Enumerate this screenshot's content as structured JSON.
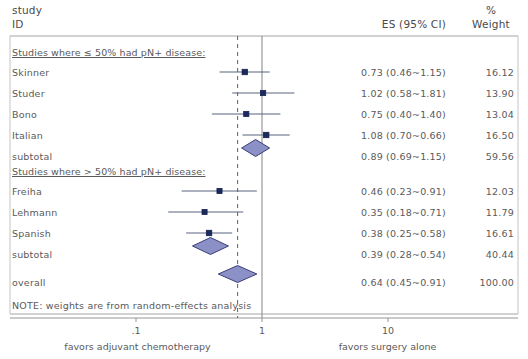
{
  "header": {
    "study_label": "study",
    "id_label": "ID",
    "es_label": "ES (95% CI)",
    "percent_label": "%",
    "weight_label": "Weight"
  },
  "note": "NOTE: weights are from random-effects analysis",
  "axis": {
    "left_caption": "favors adjuvant chemotherapy",
    "right_caption": "favors surgery alone",
    "ticks": [
      {
        "label": ".1",
        "value": 0.1
      },
      {
        "label": "1",
        "value": 1
      },
      {
        "label": "10",
        "value": 10
      }
    ],
    "null_line": 1,
    "pooled_line": 0.64,
    "xmin": 0.0631,
    "xmax": 22.0
  },
  "colors": {
    "marker_fill": "#1b2a5e",
    "marker_edge": "#16234f",
    "ci_line": "#5a6480",
    "diamond_fill": "#8b90c6",
    "diamond_edge": "#3a3f7a",
    "axis": "#8a8a8a",
    "dashed": "#6e6e6e",
    "text": "#5a5a5a"
  },
  "chart_data": {
    "type": "forest",
    "title": "",
    "xlabel": "",
    "ylabel": "",
    "effect_measure": "ES (95% CI)",
    "xscale": "log",
    "xlim": [
      0.0631,
      22.0
    ],
    "xticks": [
      0.1,
      1,
      10
    ],
    "xticklabels": [
      ".1",
      "1",
      "10"
    ],
    "null_value": 1,
    "overall_value": 0.64,
    "groups": [
      {
        "heading": "Studies  where ≤ 50% had pN+ disease:",
        "rows": [
          {
            "label": "Skinner",
            "es_text": "0.73 (0.46~1.15)",
            "weight_text": "16.12",
            "es": 0.73,
            "lcl": 0.46,
            "ucl": 1.15,
            "weight": 16.12,
            "type": "study"
          },
          {
            "label": "Studer",
            "es_text": "1.02 (0.58~1.81)",
            "weight_text": "13.90",
            "es": 1.02,
            "lcl": 0.58,
            "ucl": 1.81,
            "weight": 13.9,
            "type": "study"
          },
          {
            "label": "Bono",
            "es_text": "0.75 (0.40~1.40)",
            "weight_text": "13.04",
            "es": 0.75,
            "lcl": 0.4,
            "ucl": 1.4,
            "weight": 13.04,
            "type": "study"
          },
          {
            "label": "Italian",
            "es_text": "1.08 (0.70~0.66)",
            "weight_text": "16.50",
            "es": 1.08,
            "lcl": 0.7,
            "ucl": 1.66,
            "weight": 16.5,
            "type": "study"
          },
          {
            "label": "subtotal",
            "es_text": "0.89 (0.69~1.15)",
            "weight_text": "59.56",
            "es": 0.89,
            "lcl": 0.69,
            "ucl": 1.15,
            "weight": 59.56,
            "type": "subtotal"
          }
        ]
      },
      {
        "heading": "Studies  where > 50% had pN+ disease:",
        "rows": [
          {
            "label": "Freiha",
            "es_text": "0.46 (0.23~0.91)",
            "weight_text": "12.03",
            "es": 0.46,
            "lcl": 0.23,
            "ucl": 0.91,
            "weight": 12.03,
            "type": "study"
          },
          {
            "label": "Lehmann",
            "es_text": "0.35 (0.18~0.71)",
            "weight_text": "11.79",
            "es": 0.35,
            "lcl": 0.18,
            "ucl": 0.71,
            "weight": 11.79,
            "type": "study"
          },
          {
            "label": "Spanish",
            "es_text": "0.38 (0.25~0.58)",
            "weight_text": "16.61",
            "es": 0.38,
            "lcl": 0.25,
            "ucl": 0.58,
            "weight": 16.61,
            "type": "study"
          },
          {
            "label": "subtotal",
            "es_text": "0.39 (0.28~0.54)",
            "weight_text": "40.44",
            "es": 0.39,
            "lcl": 0.28,
            "ucl": 0.54,
            "weight": 40.44,
            "type": "subtotal"
          }
        ]
      }
    ],
    "overall": {
      "label": "overall",
      "es_text": "0.64 (0.45~0.91)",
      "weight_text": "100.00",
      "es": 0.64,
      "lcl": 0.45,
      "ucl": 0.91,
      "weight": 100.0,
      "type": "overall"
    }
  }
}
